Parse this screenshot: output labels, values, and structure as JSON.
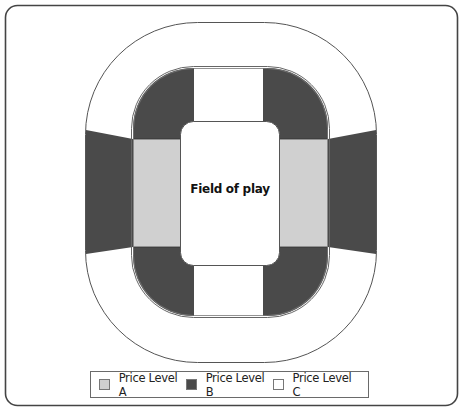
{
  "diagram": {
    "field_label": "Field of play",
    "colors": {
      "price_level_a": "#d0d0d0",
      "price_level_b": "#4a4a4a",
      "price_level_c": "#ffffff",
      "outline": "#555555",
      "frame": "#444444"
    }
  },
  "legend": {
    "items": [
      {
        "label": "Price Level A",
        "color": "#d0d0d0"
      },
      {
        "label": "Price Level B",
        "color": "#4a4a4a"
      },
      {
        "label": "Price Level C",
        "color": "#ffffff"
      }
    ]
  }
}
